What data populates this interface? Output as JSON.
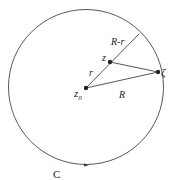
{
  "diagram": {
    "contour_label": "C",
    "center_label": "z",
    "center_subscript": "0",
    "point_label": "z",
    "boundary_point_label": "ζ",
    "segment_labels": {
      "r": "r",
      "R_minus_r": "R-r",
      "R": "R"
    },
    "colors": {
      "stroke": "#333333",
      "background": "#ffffff"
    }
  }
}
